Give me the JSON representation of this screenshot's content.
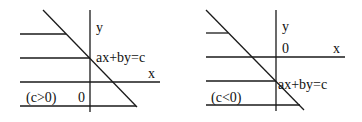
{
  "diagrams": [
    {
      "id": "left",
      "condition_label": "(c>0)",
      "y_axis_label": "y",
      "x_axis_label": "x",
      "origin_label": "0",
      "line_label": "ax+by=c"
    },
    {
      "id": "right",
      "condition_label": "(c<0)",
      "y_axis_label": "y",
      "x_axis_label": "x",
      "origin_label": "0",
      "line_label": "ax+by=c"
    }
  ],
  "colors": {
    "line": "#1a1a1a",
    "background": "#ffffff"
  }
}
